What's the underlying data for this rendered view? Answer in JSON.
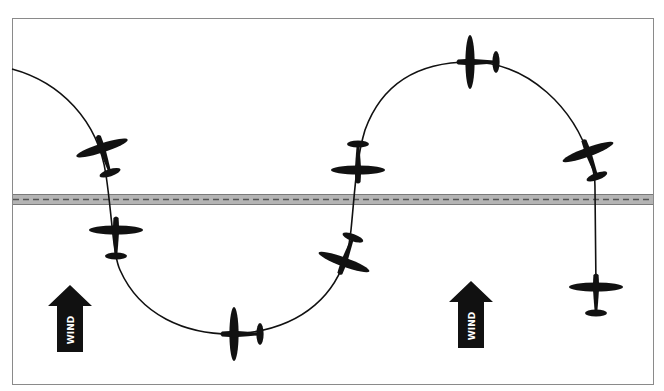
{
  "diagram": {
    "colors": {
      "background": "#ffffff",
      "frame": "#8a8a8a",
      "road_fill": "#b4b4b4",
      "road_edge": "#7a7a7a",
      "road_dash": "#555555",
      "ground_track": "#111111",
      "aircraft": "#111111",
      "wind_arrow": "#111111",
      "wind_text": "#ffffff"
    },
    "road": {
      "label": "road"
    },
    "wind_arrows": [
      {
        "label": "WIND"
      },
      {
        "label": "WIND"
      }
    ],
    "aircraft_count": 8
  }
}
